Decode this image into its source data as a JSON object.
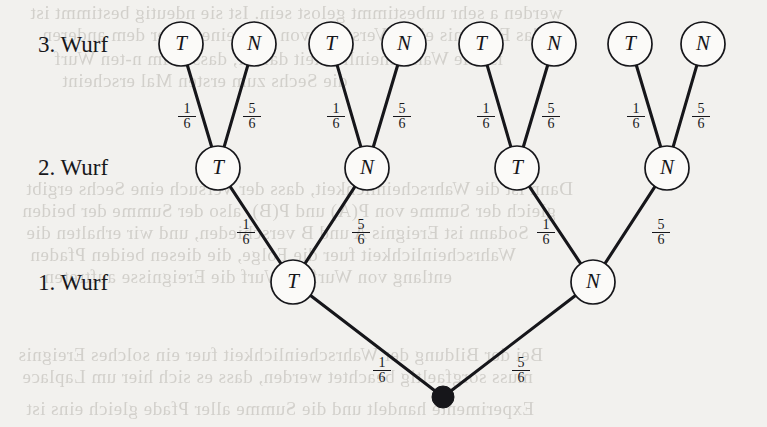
{
  "diagram": {
    "type": "probability-tree",
    "stage_labels": [
      {
        "id": "level3",
        "text": "3. Wurf",
        "x": 38,
        "y": 32
      },
      {
        "id": "level2",
        "text": "2. Wurf",
        "x": 38,
        "y": 155
      },
      {
        "id": "level1",
        "text": "1. Wurf",
        "x": 38,
        "y": 270
      }
    ],
    "root": {
      "id": "root",
      "label": "",
      "x": 443,
      "y": 397,
      "shape": "filled-dot",
      "radius": 11
    },
    "nodes": [
      {
        "id": "L1-T",
        "label": "T",
        "level": 1,
        "x": 293,
        "y": 282,
        "radius": 22
      },
      {
        "id": "L1-N",
        "label": "N",
        "level": 1,
        "x": 593,
        "y": 282,
        "radius": 22
      },
      {
        "id": "L2-TT",
        "label": "T",
        "level": 2,
        "x": 218,
        "y": 168,
        "radius": 22
      },
      {
        "id": "L2-TN",
        "label": "N",
        "level": 2,
        "x": 367,
        "y": 168,
        "radius": 22
      },
      {
        "id": "L2-NT",
        "label": "T",
        "level": 2,
        "x": 517,
        "y": 168,
        "radius": 22
      },
      {
        "id": "L2-NN",
        "label": "N",
        "level": 2,
        "x": 667,
        "y": 168,
        "radius": 22
      },
      {
        "id": "L3-1",
        "label": "T",
        "level": 3,
        "x": 181,
        "y": 44,
        "radius": 22
      },
      {
        "id": "L3-2",
        "label": "N",
        "level": 3,
        "x": 254,
        "y": 44,
        "radius": 22
      },
      {
        "id": "L3-3",
        "label": "T",
        "level": 3,
        "x": 331,
        "y": 44,
        "radius": 22
      },
      {
        "id": "L3-4",
        "label": "N",
        "level": 3,
        "x": 404,
        "y": 44,
        "radius": 22
      },
      {
        "id": "L3-5",
        "label": "T",
        "level": 3,
        "x": 481,
        "y": 44,
        "radius": 22
      },
      {
        "id": "L3-6",
        "label": "N",
        "level": 3,
        "x": 554,
        "y": 44,
        "radius": 22
      },
      {
        "id": "L3-7",
        "label": "T",
        "level": 3,
        "x": 630,
        "y": 44,
        "radius": 22
      },
      {
        "id": "L3-8",
        "label": "N",
        "level": 3,
        "x": 703,
        "y": 44,
        "radius": 22
      }
    ],
    "edges": [
      {
        "id": "e-root-T",
        "from": "root",
        "to": "L1-T"
      },
      {
        "id": "e-root-N",
        "from": "root",
        "to": "L1-N"
      },
      {
        "id": "e-T-TT",
        "from": "L1-T",
        "to": "L2-TT"
      },
      {
        "id": "e-T-TN",
        "from": "L1-T",
        "to": "L2-TN"
      },
      {
        "id": "e-N-NT",
        "from": "L1-N",
        "to": "L2-NT"
      },
      {
        "id": "e-N-NN",
        "from": "L1-N",
        "to": "L2-NN"
      },
      {
        "id": "e-TT-1",
        "from": "L2-TT",
        "to": "L3-1"
      },
      {
        "id": "e-TT-2",
        "from": "L2-TT",
        "to": "L3-2"
      },
      {
        "id": "e-TN-3",
        "from": "L2-TN",
        "to": "L3-3"
      },
      {
        "id": "e-TN-4",
        "from": "L2-TN",
        "to": "L3-4"
      },
      {
        "id": "e-NT-5",
        "from": "L2-NT",
        "to": "L3-5"
      },
      {
        "id": "e-NT-6",
        "from": "L2-NT",
        "to": "L3-6"
      },
      {
        "id": "e-NN-7",
        "from": "L2-NN",
        "to": "L3-7"
      },
      {
        "id": "e-NN-8",
        "from": "L2-NN",
        "to": "L3-8"
      }
    ],
    "edge_labels": [
      {
        "id": "p-root-T",
        "num": "1",
        "den": "6",
        "x": 373,
        "y": 356
      },
      {
        "id": "p-root-N",
        "num": "5",
        "den": "6",
        "x": 512,
        "y": 356
      },
      {
        "id": "p-T-TT",
        "num": "1",
        "den": "6",
        "x": 237,
        "y": 218
      },
      {
        "id": "p-T-TN",
        "num": "5",
        "den": "6",
        "x": 352,
        "y": 218
      },
      {
        "id": "p-N-NT",
        "num": "1",
        "den": "6",
        "x": 537,
        "y": 218
      },
      {
        "id": "p-N-NN",
        "num": "5",
        "den": "6",
        "x": 652,
        "y": 218
      },
      {
        "id": "p-TT-1",
        "num": "1",
        "den": "6",
        "x": 178,
        "y": 102
      },
      {
        "id": "p-TT-2",
        "num": "5",
        "den": "6",
        "x": 243,
        "y": 102
      },
      {
        "id": "p-TN-3",
        "num": "1",
        "den": "6",
        "x": 327,
        "y": 102
      },
      {
        "id": "p-TN-4",
        "num": "5",
        "den": "6",
        "x": 393,
        "y": 102
      },
      {
        "id": "p-NT-5",
        "num": "1",
        "den": "6",
        "x": 477,
        "y": 102
      },
      {
        "id": "p-NT-6",
        "num": "5",
        "den": "6",
        "x": 542,
        "y": 102
      },
      {
        "id": "p-NN-7",
        "num": "1",
        "den": "6",
        "x": 627,
        "y": 102
      },
      {
        "id": "p-NN-8",
        "num": "5",
        "den": "6",
        "x": 692,
        "y": 102
      }
    ],
    "background_text": [
      {
        "text": "werden a sehr unbestimmt gelost sein. Ist sie ndeutig bestimmt ist",
        "x": 30,
        "y": 2
      },
      {
        "text": "das Ergebnis eines Versuchs von dem einen oder dem anderen",
        "x": 42,
        "y": 24
      },
      {
        "text": "ist die Wahrscheinlichkeit dafuer, dass beim n-ten Wurf",
        "x": 54,
        "y": 48
      },
      {
        "text": "die Sechs zum ersten Mal erscheint",
        "x": 62,
        "y": 70
      },
      {
        "text": "Dann ist die Wahrscheinlichkeit, dass der Versuch eine Sechs ergibt",
        "x": 26,
        "y": 178
      },
      {
        "text": "gleich der Summe von P(A) und P(B), also der Summe der beiden",
        "x": 22,
        "y": 200
      },
      {
        "text": "Sodann ist Ereignis A und B verschieden, und wir erhalten die",
        "x": 26,
        "y": 222
      },
      {
        "text": "Wahrscheinlichkeit fuer die Folge, die diesen beiden Pfaden",
        "x": 30,
        "y": 244
      },
      {
        "text": "entlang von Wurf zu Wurf die Ereignisse auftreten",
        "x": 44,
        "y": 266
      },
      {
        "text": "Bei der Bildung der Wahrscheinlichkeit fuer ein solches Ereignis",
        "x": 18,
        "y": 344
      },
      {
        "text": "muss sorgfaeltig beachtet werden, dass es sich hier um Laplace",
        "x": 22,
        "y": 366
      },
      {
        "text": "Experimente handelt und die Summe aller Pfade gleich eins ist",
        "x": 26,
        "y": 398
      }
    ],
    "colors": {
      "paper": "#f2f1ee",
      "ink": "#16161a",
      "node_fill": "#fbfaf8",
      "ghost_text": "#b9b6b0"
    }
  }
}
